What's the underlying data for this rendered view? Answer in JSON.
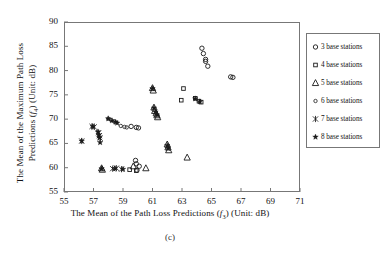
{
  "figure": {
    "caption": "(c)"
  },
  "axes": {
    "x": {
      "label_prefix": "The Mean of the Path Loss Predictions (",
      "label_symbol": "f",
      "label_sub": "3",
      "label_suffix": ") (Unit: dB)",
      "min": 55,
      "max": 71,
      "ticks": [
        55,
        57,
        59,
        61,
        63,
        65,
        67,
        69,
        71
      ],
      "tick_labels": [
        "55",
        "57",
        "59",
        "61",
        "63",
        "65",
        "67",
        "69",
        "71"
      ]
    },
    "y": {
      "label_line1": "The Mean of the Maximum Path Loss",
      "label_line2_prefix": "Predictions (",
      "label_symbol": "f",
      "label_sub": "4",
      "label_line2_suffix": ") (Unit: dB)",
      "min": 55,
      "max": 90,
      "ticks": [
        55,
        60,
        65,
        70,
        75,
        80,
        85,
        90
      ],
      "tick_labels": [
        "55",
        "60",
        "65",
        "70",
        "75",
        "80",
        "85",
        "90"
      ]
    }
  },
  "legend": {
    "items": [
      {
        "label": "3 base stations",
        "marker": "circle-dot-icon",
        "series": "3"
      },
      {
        "label": "4 base stations",
        "marker": "square-icon",
        "series": "4"
      },
      {
        "label": "5 base stations",
        "marker": "triangle-icon",
        "series": "5"
      },
      {
        "label": "6 base stations",
        "marker": "small-circle-icon",
        "series": "6"
      },
      {
        "label": "7 base stations",
        "marker": "asterisk-icon",
        "series": "7"
      },
      {
        "label": "8 base stations",
        "marker": "star-icon",
        "series": "8"
      }
    ]
  },
  "chart_data": {
    "type": "scatter",
    "title": "",
    "xlabel": "The Mean of the Path Loss Predictions (f3) (Unit: dB)",
    "ylabel": "The Mean of the Maximum Path Loss Predictions (f4) (Unit: dB)",
    "xlim": [
      55,
      71
    ],
    "ylim": [
      55,
      90
    ],
    "grid": false,
    "legend_position": "right-outside",
    "series": [
      {
        "name": "3 base stations",
        "marker": "circle",
        "points": [
          [
            64.35,
            84.6
          ],
          [
            64.45,
            83.5
          ],
          [
            64.6,
            82.3
          ],
          [
            64.6,
            81.9
          ],
          [
            64.75,
            80.9
          ],
          [
            66.3,
            78.7
          ],
          [
            66.45,
            78.6
          ],
          [
            59.55,
            68.5
          ],
          [
            59.9,
            68.3
          ],
          [
            60.05,
            68.2
          ],
          [
            59.85,
            61.5
          ],
          [
            59.9,
            60.8
          ],
          [
            60.1,
            60.3
          ],
          [
            59.95,
            59.5
          ]
        ]
      },
      {
        "name": "4 base stations",
        "marker": "square",
        "points": [
          [
            63.1,
            76.3
          ],
          [
            63.9,
            74.3
          ],
          [
            64.15,
            73.7
          ],
          [
            64.3,
            73.5
          ],
          [
            62.95,
            73.9
          ],
          [
            59.9,
            59.4
          ],
          [
            59.45,
            59.6
          ]
        ]
      },
      {
        "name": "5 base stations",
        "marker": "triangle",
        "points": [
          [
            61.0,
            76.4
          ],
          [
            61.05,
            75.9
          ],
          [
            61.1,
            72.4
          ],
          [
            61.15,
            71.7
          ],
          [
            61.25,
            71.2
          ],
          [
            61.3,
            70.8
          ],
          [
            61.35,
            70.4
          ],
          [
            62.0,
            64.8
          ],
          [
            62.05,
            64.2
          ],
          [
            62.1,
            63.6
          ],
          [
            63.35,
            62.1
          ],
          [
            59.7,
            60.3
          ],
          [
            60.55,
            59.9
          ],
          [
            57.55,
            59.9
          ],
          [
            57.6,
            59.6
          ]
        ]
      },
      {
        "name": "6 base stations",
        "marker": "circle-small",
        "points": [
          [
            58.85,
            68.6
          ],
          [
            59.1,
            68.4
          ],
          [
            59.25,
            68.3
          ],
          [
            58.0,
            70.1
          ],
          [
            58.2,
            69.8
          ],
          [
            58.4,
            69.5
          ]
        ]
      },
      {
        "name": "7 base stations",
        "marker": "asterisk",
        "points": [
          [
            56.9,
            68.5
          ],
          [
            57.05,
            68.4
          ],
          [
            57.35,
            67.2
          ],
          [
            57.4,
            66.6
          ],
          [
            57.45,
            66.1
          ],
          [
            56.2,
            65.5
          ],
          [
            58.3,
            59.8
          ],
          [
            58.55,
            59.9
          ],
          [
            58.9,
            59.7
          ]
        ]
      },
      {
        "name": "8 base stations",
        "marker": "star",
        "points": [
          [
            57.3,
            67.4
          ],
          [
            57.35,
            66.8
          ],
          [
            57.4,
            66.2
          ],
          [
            57.45,
            65.2
          ],
          [
            56.2,
            65.5
          ],
          [
            56.95,
            68.5
          ],
          [
            58.0,
            70.1
          ],
          [
            58.25,
            69.7
          ],
          [
            58.5,
            69.4
          ],
          [
            58.6,
            69.2
          ],
          [
            61.1,
            72.3
          ],
          [
            61.2,
            71.5
          ],
          [
            61.3,
            70.9
          ],
          [
            61.0,
            76.3
          ],
          [
            63.9,
            74.2
          ],
          [
            64.2,
            73.6
          ],
          [
            62.0,
            64.6
          ],
          [
            62.05,
            64.0
          ],
          [
            58.45,
            59.85
          ],
          [
            59.0,
            59.7
          ],
          [
            57.55,
            59.8
          ]
        ]
      }
    ]
  }
}
